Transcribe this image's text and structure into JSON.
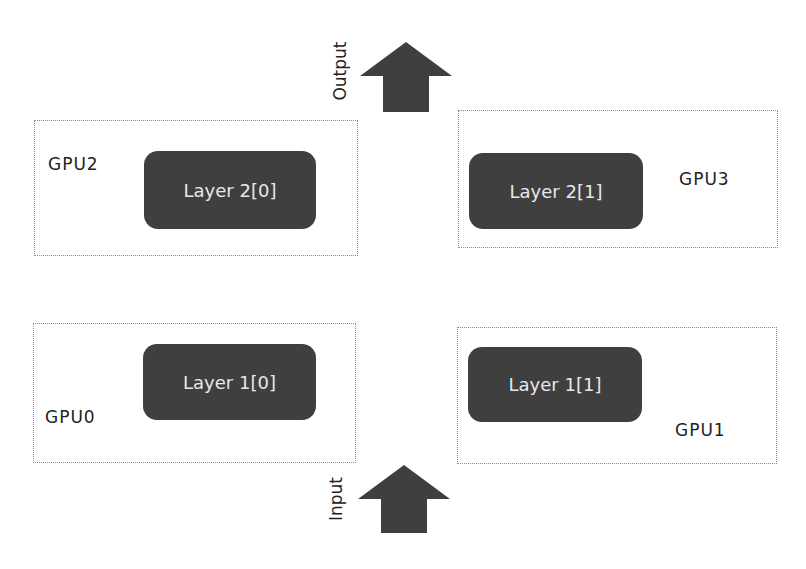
{
  "diagram": {
    "title": "",
    "output": {
      "label": "Output",
      "icon": "up-arrow-icon",
      "color": "#3f3f3f"
    },
    "input": {
      "label": "Input",
      "icon": "up-arrow-icon",
      "color": "#3f3f3f"
    },
    "gpus": [
      {
        "id": "gpu2",
        "label": "GPU2",
        "layer": "Layer 2[0]",
        "position": "top-left"
      },
      {
        "id": "gpu3",
        "label": "GPU3",
        "layer": "Layer 2[1]",
        "position": "top-right"
      },
      {
        "id": "gpu0",
        "label": "GPU0",
        "layer": "Layer 1[0]",
        "position": "bottom-left"
      },
      {
        "id": "gpu1",
        "label": "GPU1",
        "layer": "Layer 1[1]",
        "position": "bottom-right"
      }
    ],
    "colors": {
      "layer_fill": "#3f3f3f",
      "layer_text": "#e8e8e8",
      "box_border": "#8a8a8a",
      "text": "#222222"
    }
  }
}
